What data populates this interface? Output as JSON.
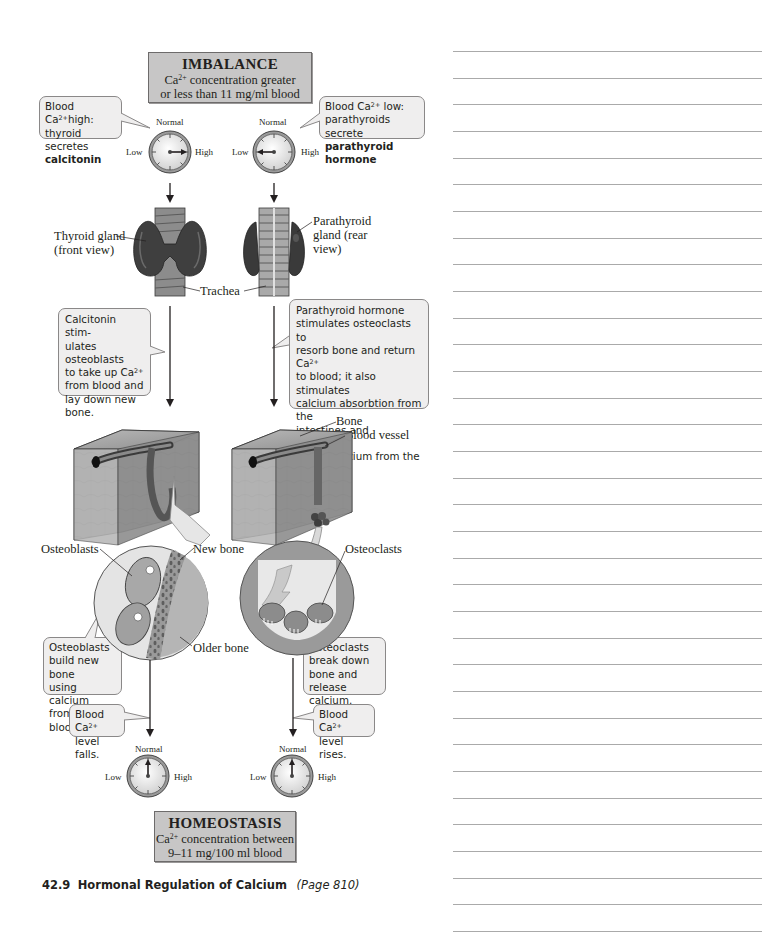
{
  "figure": {
    "number": "42.9",
    "title": "Hormonal Regulation of Calcium",
    "page_ref": "(Page 810)"
  },
  "imbalance": {
    "title": "IMBALANCE",
    "line1_prefix": "Ca",
    "line1_sup": "2+",
    "line1_suffix": " concentration greater",
    "line2": "or less than 11 mg/ml blood"
  },
  "homeostasis": {
    "title": "HOMEOSTASIS",
    "line1_prefix": "Ca",
    "line1_sup": "2+",
    "line1_suffix": " concentration between",
    "line2": "9–11 mg/100 ml blood"
  },
  "dials": {
    "labels": {
      "top": "Normal",
      "left": "Low",
      "right": "High"
    },
    "top_left": {
      "reading": "High"
    },
    "top_right": {
      "reading": "Low"
    },
    "bottom_left": {
      "reading": "Normal"
    },
    "bottom_right": {
      "reading": "Normal"
    }
  },
  "bubbles": {
    "high_ca": {
      "line1_prefix": "Blood Ca",
      "line1_sup": "2+",
      "line1_suffix": "high:",
      "line2": "thyroid secretes",
      "line3_bold": "calcitonin"
    },
    "low_ca": {
      "line1_prefix": "Blood Ca",
      "line1_sup": "2+",
      "line1_suffix": " low:",
      "line2": "parathyroids secrete",
      "line3_bold": "parathyroid hormone"
    },
    "calcitonin_action": {
      "l1": "Calcitonin stim-",
      "l2": "ulates osteoblasts",
      "l3_prefix": "to take up Ca",
      "l3_sup": "2+",
      "l4": "from blood and",
      "l5": "lay down new",
      "l6": "bone."
    },
    "pth_action": {
      "l1": "Parathyroid hormone",
      "l2": "stimulates osteoclasts to",
      "l3_prefix": "resorb bone and return Ca",
      "l3_sup": "2+",
      "l4": "to blood; it also stimulates",
      "l5": "calcium absorbtion from the",
      "l6": "intestines and decreased",
      "l7": "loss of calcium from the",
      "l8": "kidneys."
    },
    "osteoblasts_build": {
      "l1": "Osteoblasts",
      "l2": "build new bone",
      "l3": "using calcium",
      "l4": "from the blood."
    },
    "osteoclasts_break": {
      "l1": "Osteoclasts",
      "l2": "break down",
      "l3": "bone and",
      "l4": "release calcium."
    },
    "level_falls": {
      "l1_prefix": "Blood Ca",
      "l1_sup": "2+",
      "l2": "level falls."
    },
    "level_rises": {
      "l1_prefix": "Blood Ca",
      "l1_sup": "2+",
      "l2": "level rises."
    }
  },
  "labels": {
    "thyroid_l1": "Thyroid gland",
    "thyroid_l2": "(front view)",
    "parathyroid_l1": "Parathyroid",
    "parathyroid_l2": "gland (rear",
    "parathyroid_l3": "view)",
    "trachea": "Trachea",
    "bone": "Bone",
    "blood_vessel": "Blood vessel",
    "osteoblasts": "Osteoblasts",
    "new_bone": "New bone",
    "older_bone": "Older bone",
    "osteoclasts": "Osteoclasts"
  },
  "notes_area": {
    "ruled_line_count": 34
  }
}
